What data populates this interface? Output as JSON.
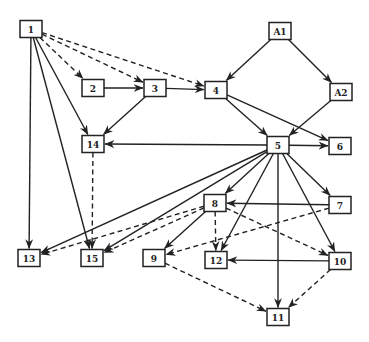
{
  "diagram": {
    "type": "directed-graph",
    "width": 369,
    "height": 342,
    "colors": {
      "stroke": "#222222",
      "fill": "#ffffff",
      "background": "#ffffff"
    },
    "node_size": {
      "w": 22,
      "h": 17
    },
    "nodes": [
      {
        "id": "1",
        "label": "1",
        "x": 31,
        "y": 29
      },
      {
        "id": "A1",
        "label": "A1",
        "x": 280,
        "y": 31
      },
      {
        "id": "2",
        "label": "2",
        "x": 93,
        "y": 88
      },
      {
        "id": "3",
        "label": "3",
        "x": 155,
        "y": 88
      },
      {
        "id": "4",
        "label": "4",
        "x": 216,
        "y": 90
      },
      {
        "id": "A2",
        "label": "A2",
        "x": 341,
        "y": 92
      },
      {
        "id": "14",
        "label": "14",
        "x": 93,
        "y": 144
      },
      {
        "id": "5",
        "label": "5",
        "x": 278,
        "y": 145
      },
      {
        "id": "6",
        "label": "6",
        "x": 340,
        "y": 146
      },
      {
        "id": "8",
        "label": "8",
        "x": 215,
        "y": 203
      },
      {
        "id": "7",
        "label": "7",
        "x": 340,
        "y": 205
      },
      {
        "id": "13",
        "label": "13",
        "x": 29,
        "y": 258
      },
      {
        "id": "15",
        "label": "15",
        "x": 92,
        "y": 258
      },
      {
        "id": "9",
        "label": "9",
        "x": 154,
        "y": 258
      },
      {
        "id": "12",
        "label": "12",
        "x": 216,
        "y": 260
      },
      {
        "id": "10",
        "label": "10",
        "x": 340,
        "y": 261
      },
      {
        "id": "11",
        "label": "11",
        "x": 278,
        "y": 317
      }
    ],
    "edges": [
      {
        "from": "1",
        "to": "2",
        "style": "dashed"
      },
      {
        "from": "1",
        "to": "3",
        "style": "dashed"
      },
      {
        "from": "1",
        "to": "4",
        "style": "dashed"
      },
      {
        "from": "1",
        "to": "14",
        "style": "solid"
      },
      {
        "from": "1",
        "to": "15",
        "style": "solid"
      },
      {
        "from": "1",
        "to": "13",
        "style": "solid"
      },
      {
        "from": "2",
        "to": "3",
        "style": "solid"
      },
      {
        "from": "3",
        "to": "4",
        "style": "solid"
      },
      {
        "from": "3",
        "to": "14",
        "style": "solid"
      },
      {
        "from": "A1",
        "to": "4",
        "style": "solid"
      },
      {
        "from": "A1",
        "to": "A2",
        "style": "solid"
      },
      {
        "from": "4",
        "to": "5",
        "style": "solid"
      },
      {
        "from": "4",
        "to": "6",
        "style": "solid"
      },
      {
        "from": "A2",
        "to": "5",
        "style": "solid"
      },
      {
        "from": "5",
        "to": "14",
        "style": "solid"
      },
      {
        "from": "5",
        "to": "6",
        "style": "solid"
      },
      {
        "from": "5",
        "to": "7",
        "style": "solid"
      },
      {
        "from": "5",
        "to": "8",
        "style": "solid"
      },
      {
        "from": "5",
        "to": "13",
        "style": "solid"
      },
      {
        "from": "5",
        "to": "15",
        "style": "solid"
      },
      {
        "from": "5",
        "to": "12",
        "style": "solid"
      },
      {
        "from": "5",
        "to": "11",
        "style": "solid"
      },
      {
        "from": "5",
        "to": "10",
        "style": "solid"
      },
      {
        "from": "14",
        "to": "15",
        "style": "dashed"
      },
      {
        "from": "7",
        "to": "8",
        "style": "solid"
      },
      {
        "from": "7",
        "to": "9",
        "style": "dashed"
      },
      {
        "from": "8",
        "to": "13",
        "style": "dashed"
      },
      {
        "from": "8",
        "to": "15",
        "style": "dashed"
      },
      {
        "from": "8",
        "to": "9",
        "style": "solid"
      },
      {
        "from": "8",
        "to": "12",
        "style": "dashed"
      },
      {
        "from": "8",
        "to": "10",
        "style": "dashed"
      },
      {
        "from": "10",
        "to": "12",
        "style": "solid"
      },
      {
        "from": "10",
        "to": "11",
        "style": "dashed"
      },
      {
        "from": "9",
        "to": "11",
        "style": "dashed"
      }
    ]
  }
}
